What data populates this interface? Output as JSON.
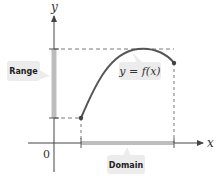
{
  "diagram": {
    "axes": {
      "x_label": "x",
      "y_label": "y",
      "origin_label": "0"
    },
    "function_label": "y = f(x)",
    "range_label": "Range",
    "domain_label": "Domain",
    "colors": {
      "curve": "#555555",
      "axis": "#444444",
      "highlight_bar": "#bdbdbd",
      "callout_bg": "#ececec",
      "dashed": "#555555"
    }
  }
}
